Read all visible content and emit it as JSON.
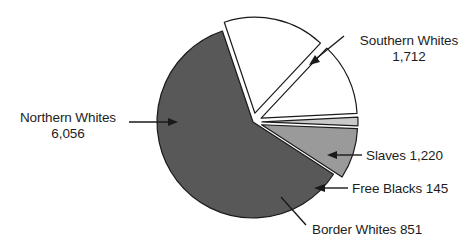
{
  "chart_data": {
    "type": "pie",
    "title": "",
    "subtitle": "",
    "xlabel": "",
    "ylabel": "",
    "legend_position": "callout-labels",
    "grid": false,
    "total": 9984,
    "units": "thousands",
    "categories": [
      "Northern Whites",
      "Southern Whites",
      "Slaves",
      "Free Blacks",
      "Border Whites"
    ],
    "values": [
      6056,
      1712,
      1220,
      145,
      851
    ],
    "value_labels": [
      "6,056",
      "1,712",
      "1,220",
      "145",
      "851"
    ],
    "colors": [
      "#585858",
      "#ffffff",
      "#ffffff",
      "#c9c9c9",
      "#9a9a9a"
    ],
    "slices": [
      {
        "name": "Northern Whites",
        "value": 6056,
        "value_label": "6,056",
        "color": "#585858",
        "start_angle": 123.0,
        "sweep_angle": 218.4,
        "exploded": false
      },
      {
        "name": "Southern Whites",
        "value": 1712,
        "value_label": "1,712",
        "color": "#ffffff",
        "start_angle": 341.4,
        "sweep_angle": 61.7,
        "exploded": true
      },
      {
        "name": "Slaves",
        "value": 1220,
        "value_label": "1,220",
        "color": "#ffffff",
        "start_angle": 43.1,
        "sweep_angle": 44.0,
        "exploded": true
      },
      {
        "name": "Free Blacks",
        "value": 145,
        "value_label": "145",
        "color": "#c9c9c9",
        "start_angle": 87.1,
        "sweep_angle": 5.2,
        "exploded": true
      },
      {
        "name": "Border Whites",
        "value": 851,
        "value_label": "851",
        "color": "#9a9a9a",
        "start_angle": 92.3,
        "sweep_angle": 30.7,
        "exploded": true
      }
    ]
  },
  "labels": {
    "northern_whites": {
      "line1": "Northern Whites",
      "line2": "6,056"
    },
    "southern_whites": {
      "line1": "Southern Whites",
      "line2": "1,712"
    },
    "slaves": {
      "line1": "Slaves 1,220"
    },
    "free_blacks": {
      "line1": "Free Blacks 145"
    },
    "border_whites": {
      "line1": "Border Whites 851"
    }
  },
  "style": {
    "stroke": "#1a1a1a",
    "background": "#ffffff",
    "text_color": "#1d1d1d"
  }
}
